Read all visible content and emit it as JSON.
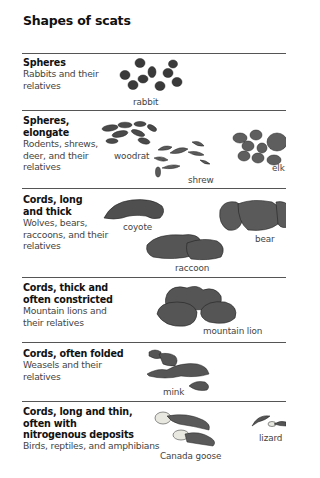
{
  "title": "Shapes of scats",
  "sections": [
    {
      "heading": [
        "Spheres"
      ],
      "description": [
        "Rabbits and their",
        "relatives"
      ],
      "examples": [
        "rabbit"
      ]
    },
    {
      "heading": [
        "Spheres,",
        "elongate"
      ],
      "description": [
        "Rodents, shrews,",
        "deer, and their",
        "relatives"
      ],
      "examples": [
        "woodrat",
        "shrew",
        "elk"
      ]
    },
    {
      "heading": [
        "Cords, long",
        "and thick"
      ],
      "description": [
        "Wolves, bears,",
        "raccoons, and their",
        "relatives"
      ],
      "examples": [
        "coyote",
        "bear",
        "raccoon"
      ]
    },
    {
      "heading": [
        "Cords, thick and",
        "often constricted"
      ],
      "description": [
        "Mountain lions and",
        "their relatives"
      ],
      "examples": [
        "mountain lion"
      ]
    },
    {
      "heading": [
        "Cords, often folded"
      ],
      "description": [
        "Weasels and their",
        "relatives"
      ],
      "examples": [
        "mink"
      ]
    },
    {
      "heading": [
        "Cords, long and thin,",
        "often with",
        "nitrogenous deposits"
      ],
      "description": [
        "Birds, reptiles, and amphibians"
      ],
      "examples": [
        "Canada goose",
        "lizard"
      ]
    }
  ]
}
